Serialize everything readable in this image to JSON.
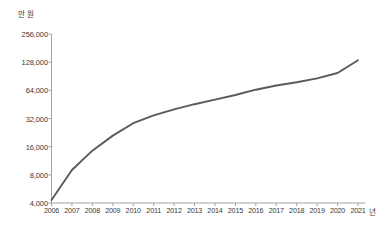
{
  "chart_data": {
    "type": "line",
    "title": "",
    "subtitle": "",
    "xlabel": "년",
    "ylabel": "만 원",
    "yscale": "log2",
    "ylim": [
      4000,
      256000
    ],
    "xlim": [
      2006,
      2021
    ],
    "grid": false,
    "legend": null,
    "y_ticks": [
      4000,
      8000,
      16000,
      32000,
      64000,
      128000,
      256000
    ],
    "y_tick_labels": [
      "4,000",
      "8,000",
      "16,000",
      "32,000",
      "64,000",
      "128,000",
      "256,000"
    ],
    "x_ticks": [
      2006,
      2007,
      2008,
      2009,
      2010,
      2011,
      2012,
      2013,
      2014,
      2015,
      2016,
      2017,
      2018,
      2019,
      2020,
      2021
    ],
    "x_tick_labels": [
      "2006",
      "2007",
      "2008",
      "2009",
      "2010",
      "2011",
      "2012",
      "2013",
      "2014",
      "2015",
      "2016",
      "2017",
      "2018",
      "2019",
      "2020",
      "2021"
    ],
    "series": [
      {
        "name": "value",
        "color": "#5a5a5a",
        "x": [
          2006,
          2007,
          2008,
          2009,
          2010,
          2011,
          2012,
          2013,
          2014,
          2015,
          2016,
          2017,
          2018,
          2019,
          2020,
          2021
        ],
        "values": [
          4300,
          9000,
          14500,
          21000,
          28500,
          34500,
          40000,
          45500,
          51000,
          57000,
          65000,
          72000,
          78000,
          86000,
          98000,
          134000
        ]
      }
    ]
  },
  "axis": {
    "unit_y": "만 원",
    "unit_x": "년"
  },
  "colors": {
    "line": "#5a5a5a",
    "axis": "#9a9a9a",
    "text": "#3a3a3a"
  }
}
